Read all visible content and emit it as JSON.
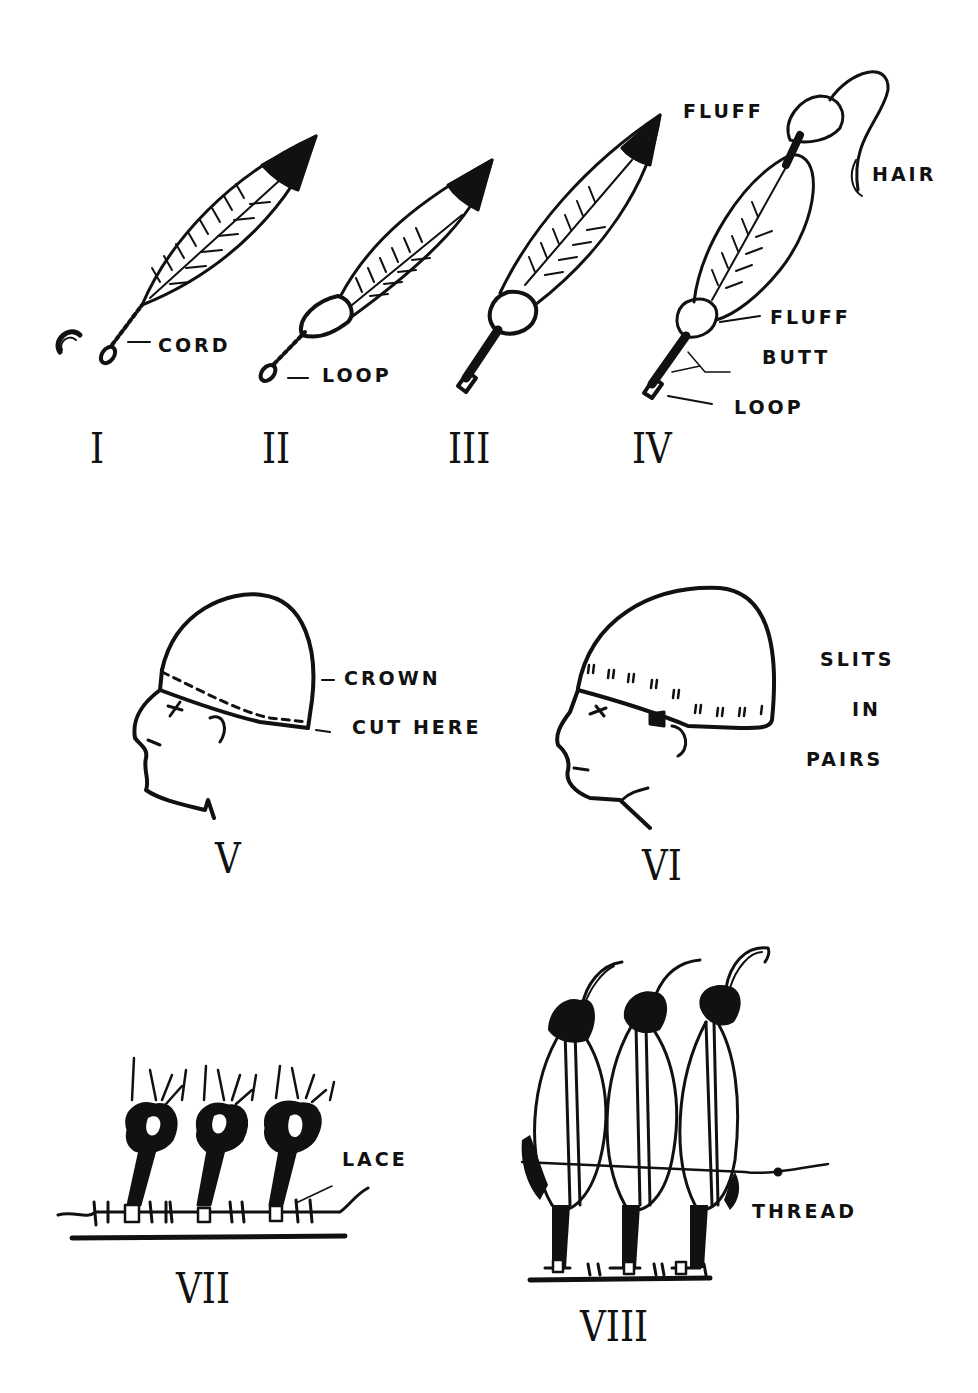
{
  "colors": {
    "ink": "#111111",
    "paper": "#ffffff"
  },
  "figures": [
    {
      "id": "I",
      "numeral": "I",
      "labels": [
        "CORD"
      ]
    },
    {
      "id": "II",
      "numeral": "II",
      "labels": [
        "LOOP"
      ]
    },
    {
      "id": "III",
      "numeral": "III",
      "labels": []
    },
    {
      "id": "IV",
      "numeral": "IV",
      "labels": [
        "FLUFF",
        "HAIR",
        "FLUFF",
        "BUTT",
        "LOOP"
      ]
    },
    {
      "id": "V",
      "numeral": "V",
      "labels": [
        "CROWN",
        "CUT HERE"
      ]
    },
    {
      "id": "VI",
      "numeral": "VI",
      "labels": [
        "SLITS",
        "IN",
        "PAIRS"
      ]
    },
    {
      "id": "VII",
      "numeral": "VII",
      "labels": [
        "LACE"
      ]
    },
    {
      "id": "VIII",
      "numeral": "VIII",
      "labels": [
        "THREAD"
      ]
    }
  ]
}
